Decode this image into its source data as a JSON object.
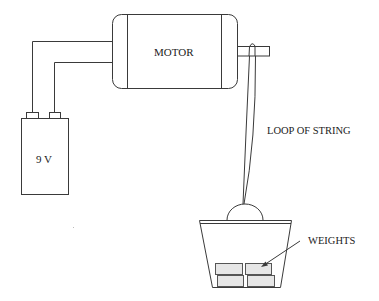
{
  "diagram": {
    "type": "apparatus",
    "labels": {
      "motor": "MOTOR",
      "battery": "9 V",
      "string": "LOOP OF STRING",
      "weights": "WEIGHTS"
    },
    "colors": {
      "line": "#3a3a3a",
      "weight_fill": "#e6e6e6",
      "background": "#ffffff"
    },
    "components": [
      {
        "id": "battery",
        "label": "9 V"
      },
      {
        "id": "wires",
        "count": 2
      },
      {
        "id": "motor",
        "label": "MOTOR"
      },
      {
        "id": "shaft"
      },
      {
        "id": "string-loop",
        "label": "LOOP OF STRING"
      },
      {
        "id": "basket"
      },
      {
        "id": "weights",
        "count": 4,
        "label": "WEIGHTS"
      }
    ]
  }
}
